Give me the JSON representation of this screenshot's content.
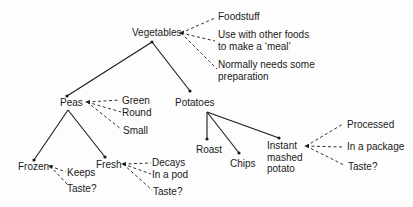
{
  "diagram": {
    "root": {
      "label": "Vegetables",
      "attributes": [
        "Foodstuff",
        "Use with other foods\nto make a ‘meal’",
        "Normally needs some\npreparation"
      ]
    },
    "nodes": {
      "peas": {
        "label": "Peas",
        "attributes": [
          "Green",
          "Round",
          "Small"
        ]
      },
      "potatoes": {
        "label": "Potatoes"
      },
      "frozen": {
        "label": "Frozen",
        "attributes": [
          "Keeps",
          "Taste?"
        ]
      },
      "fresh": {
        "label": "Fresh",
        "attributes": [
          "Decays",
          "In a pod",
          "Taste?"
        ]
      },
      "roast": {
        "label": "Roast"
      },
      "chips": {
        "label": "Chips"
      },
      "instant": {
        "label": "Instant\nmashed\npotato",
        "attributes": [
          "Processed",
          "In a package",
          "Taste?"
        ]
      }
    },
    "edges": [
      [
        "Vegetables",
        "Peas"
      ],
      [
        "Vegetables",
        "Potatoes"
      ],
      [
        "Peas",
        "Frozen"
      ],
      [
        "Peas",
        "Fresh"
      ],
      [
        "Potatoes",
        "Roast"
      ],
      [
        "Potatoes",
        "Chips"
      ],
      [
        "Potatoes",
        "Instant mashed potato"
      ]
    ],
    "colors": {
      "ink": "#1a1a1a",
      "background": "#fdfdfd"
    }
  }
}
